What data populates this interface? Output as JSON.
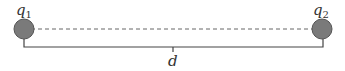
{
  "charges": [
    {
      "label": "q",
      "subscript": "1",
      "cx": 24,
      "cy": 29,
      "r": 10
    },
    {
      "label": "q",
      "subscript": "2",
      "cx": 322,
      "cy": 29,
      "r": 10
    }
  ],
  "distance": {
    "label": "d"
  },
  "colors": {
    "charge_fill": "#7a7a7a",
    "charge_stroke": "#555555",
    "line": "#444444",
    "dashed": "#666666"
  }
}
